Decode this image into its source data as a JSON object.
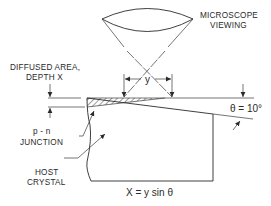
{
  "diagram": {
    "type": "angle-lap cross-section",
    "labels": {
      "microscope_line1": "MICROSCOPE",
      "microscope_line2": "VIEWING",
      "diffused_line1": "DIFFUSED AREA,",
      "diffused_line2": "DEPTH X",
      "dimension_y": "y",
      "angle": "θ = 10°",
      "pn_line1": "p - n",
      "pn_line2": "JUNCTION",
      "host_line1": "HOST",
      "host_line2": "CRYSTAL",
      "formula": "X = y sin θ"
    },
    "colors": {
      "ink": "#2a2a2a",
      "background": "#ffffff"
    }
  }
}
